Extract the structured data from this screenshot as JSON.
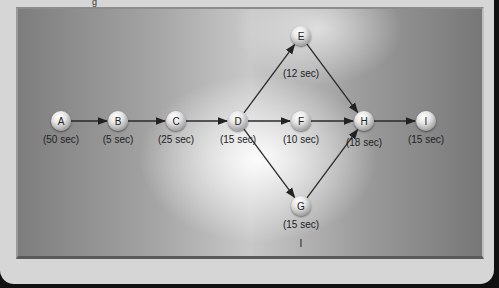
{
  "header": {
    "glyph": "g"
  },
  "diagram": {
    "type": "precedence-network",
    "nodes": [
      {
        "id": "A",
        "time": "(50 sec)",
        "x": 61,
        "y": 121
      },
      {
        "id": "B",
        "time": "(5 sec)",
        "x": 118,
        "y": 121
      },
      {
        "id": "C",
        "time": "(25 sec)",
        "x": 176,
        "y": 121
      },
      {
        "id": "D",
        "time": "(15 sec)",
        "x": 238,
        "y": 121
      },
      {
        "id": "E",
        "time": "(12 sec)",
        "x": 301,
        "y": 36
      },
      {
        "id": "F",
        "time": "(10 sec)",
        "x": 301,
        "y": 121
      },
      {
        "id": "G",
        "time": "(15 sec)",
        "x": 301,
        "y": 206
      },
      {
        "id": "H",
        "time": "(18 sec)",
        "x": 364,
        "y": 121
      },
      {
        "id": "I",
        "time": "(15 sec)",
        "x": 426,
        "y": 121
      }
    ],
    "edges": [
      [
        "A",
        "B"
      ],
      [
        "B",
        "C"
      ],
      [
        "C",
        "D"
      ],
      [
        "D",
        "E"
      ],
      [
        "D",
        "F"
      ],
      [
        "D",
        "G"
      ],
      [
        "E",
        "H"
      ],
      [
        "F",
        "H"
      ],
      [
        "G",
        "H"
      ],
      [
        "H",
        "I"
      ]
    ],
    "footnote": "I"
  }
}
